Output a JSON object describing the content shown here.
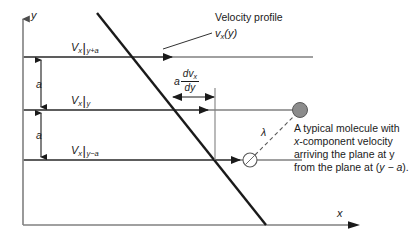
{
  "figure": {
    "title_caption": "",
    "axes": {
      "y_label": "y",
      "x_label": "x"
    },
    "profile": {
      "caption": "Velocity profile",
      "symbol_v": "v",
      "symbol_sub": "x",
      "symbol_arg": "(y)"
    },
    "gap_labels": {
      "upper": "a",
      "lower": "a"
    },
    "plane_labels": [
      {
        "v": "V",
        "sub_v": "x",
        "bar": "|",
        "level": "y+a"
      },
      {
        "v": "V",
        "sub_v": "x",
        "bar": "|",
        "level": "y"
      },
      {
        "v": "V",
        "sub_v": "x",
        "bar": "|",
        "level": "y−a"
      }
    ],
    "gradient_annotation": {
      "coefficient": "a",
      "numerator": "dv",
      "numerator_sub": "x",
      "denominator": "dy"
    },
    "mean_free_path_label": "λ",
    "note": {
      "line1": "A typical molecule with",
      "line2_italic": "x",
      "line2_rest": "-component velocity",
      "line3": "arriving the plane at y",
      "line4_pre": "from the plane at (",
      "line4_italic": "y − a",
      "line4_post": ")."
    },
    "colors": {
      "axis": "#808080",
      "plane_line": "#808080",
      "profile": "#1a1a1a",
      "molecule_fill": "#8c8c8c",
      "molecule_stroke": "#4d4d4d",
      "text": "#1a1a1a",
      "background": "#ffffff"
    }
  }
}
